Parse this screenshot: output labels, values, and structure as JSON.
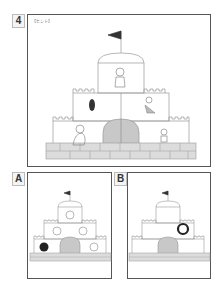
{
  "puzzle": {
    "number": "4",
    "hint_label": "【ヒント】",
    "main_scene": {
      "description": "castle with characters",
      "characters": [
        "princess-top",
        "dark-figure-left",
        "fairy-right",
        "old-woman-bottom-left",
        "boy-bottom-right"
      ],
      "flag_symbol": "S"
    },
    "options": [
      {
        "label": "A",
        "description": "castle with apples",
        "items": [
          "apple",
          "apple",
          "apple",
          "black-apple",
          "apple"
        ]
      },
      {
        "label": "B",
        "description": "castle with ring",
        "items": [
          "black-ring"
        ]
      }
    ]
  },
  "colors": {
    "frame": "#555555",
    "line": "#999999",
    "door": "#c8c8c8",
    "brick": "#d8d8d8",
    "dark": "#222222"
  }
}
